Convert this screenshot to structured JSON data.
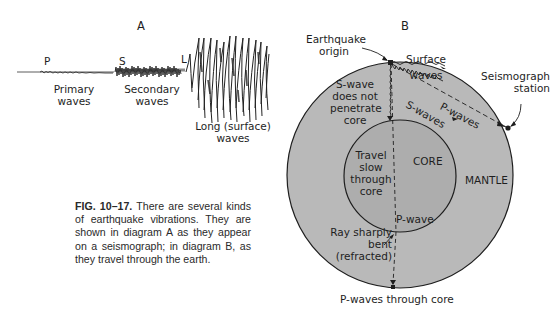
{
  "diagram_a": {
    "title": "A",
    "markers": {
      "p": "P",
      "s": "S",
      "l": "L"
    },
    "labels": {
      "primary_line1": "Primary",
      "primary_line2": "waves",
      "secondary_line1": "Secondary",
      "secondary_line2": "waves",
      "long_line1": "Long (surface)",
      "long_line2": "waves"
    }
  },
  "diagram_b": {
    "title": "B",
    "labels": {
      "origin_line1": "Earthquake",
      "origin_line2": "origin",
      "surface_line1": "Surface",
      "surface_line2": "waves",
      "station_line1": "Seismograph",
      "station_line2": "station",
      "swave_note_line1": "S-wave",
      "swave_note_line2": "does not",
      "swave_note_line3": "penetrate",
      "swave_note_line4": "core",
      "p_waves": "P-waves",
      "s_waves": "S-waves",
      "travel_line1": "Travel",
      "travel_line2": "slow",
      "travel_line3": "through",
      "travel_line4": "core",
      "core": "CORE",
      "mantle": "MANTLE",
      "p_wave": "P-wave",
      "ray_line1": "Ray sharply",
      "ray_line2": "bent",
      "ray_line3": "(refracted)",
      "bottom": "P-waves through core"
    },
    "colors": {
      "mantle": "#b9b9b9",
      "core": "#adadad",
      "ink": "#1e1e1e"
    }
  },
  "caption": {
    "figure_number": "FIG. 10–17.",
    "text": "There are several kinds of earthquake vibrations. They are shown in diagram A as they appear on a seismograph; in diagram B, as they travel through the earth."
  }
}
